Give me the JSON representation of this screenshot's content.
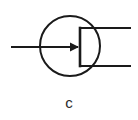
{
  "figure": {
    "kind": "electronic-schematic-symbol",
    "symbol_name": "transistor-symbol",
    "caption": "c",
    "background_color": "#ffffff",
    "stroke_color": "#1a1a1a",
    "stroke_width": 2,
    "envelope": {
      "shape": "circle",
      "center_x": 70,
      "center_y": 46,
      "radius": 30
    },
    "base_bar": {
      "x": 80,
      "y_top": 28,
      "y_bottom": 66
    },
    "leads": [
      {
        "name": "base-lead",
        "orientation": "horizontal",
        "x_start": 11,
        "x_end": 80,
        "y": 47,
        "has_arrow": true,
        "arrow_direction": "right"
      },
      {
        "name": "collector-lead",
        "orientation": "horizontal",
        "x_start": 80,
        "x_end": 131,
        "y": 28,
        "has_arrow": false,
        "arrow_direction": ""
      },
      {
        "name": "emitter-lead",
        "orientation": "horizontal",
        "x_start": 80,
        "x_end": 131,
        "y": 66,
        "has_arrow": false,
        "arrow_direction": ""
      }
    ]
  }
}
